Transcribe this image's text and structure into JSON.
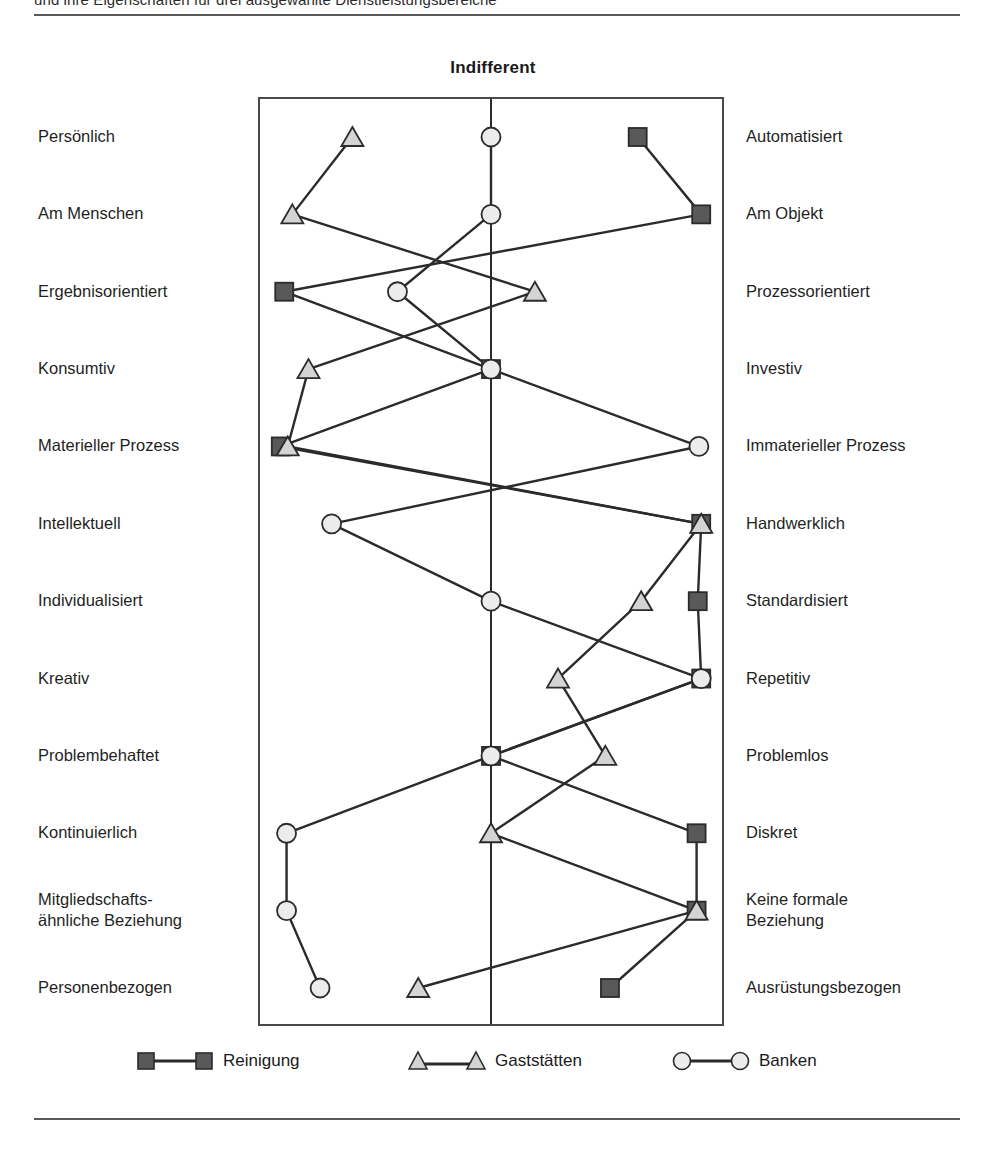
{
  "page": {
    "running_head": "und ihre Eigenschaften für drei ausgewählte Dienstleistungsbereiche"
  },
  "chart": {
    "title": "Indifferent",
    "axis_center_label": "Indifferent"
  },
  "legend": {
    "items": [
      {
        "name": "Reinigung",
        "marker": "square-marker",
        "fill": "#595959",
        "stroke": "#2b2b2b"
      },
      {
        "name": "Gaststätten",
        "marker": "triangle-marker",
        "fill": "#d4d4d4",
        "stroke": "#2b2b2b"
      },
      {
        "name": "Banken",
        "marker": "circle-marker",
        "fill": "#ececec",
        "stroke": "#2b2b2b"
      }
    ]
  },
  "chart_data": {
    "type": "line",
    "title": "Indifferent",
    "xlabel": "",
    "ylabel": "",
    "orientation": "horizontal-profile",
    "grid": false,
    "legend_position": "bottom",
    "xlim": [
      -2,
      2
    ],
    "axis_center": 0,
    "categories": [
      {
        "left": "Persönlich",
        "right": "Automatisiert"
      },
      {
        "left": "Am Menschen",
        "right": "Am Objekt"
      },
      {
        "left": "Ergebnisorientiert",
        "right": "Prozessorientiert"
      },
      {
        "left": "Konsumtiv",
        "right": "Investiv"
      },
      {
        "left": "Materieller Prozess",
        "right": "Immaterieller Prozess"
      },
      {
        "left": "Intellektuell",
        "right": "Handwerklich"
      },
      {
        "left": "Individualisiert",
        "right": "Standardisiert"
      },
      {
        "left": "Kreativ",
        "right": "Repetitiv"
      },
      {
        "left": "Problembehaftet",
        "right": "Problemlos"
      },
      {
        "left": "Kontinuierlich",
        "right": "Diskret"
      },
      {
        "left": "Mitgliedschafts-\nähnliche Beziehung",
        "right": "Keine formale\nBeziehung"
      },
      {
        "left": "Personenbezogen",
        "right": "Ausrüstungsbezogen"
      }
    ],
    "series": [
      {
        "name": "Reinigung",
        "marker": "square",
        "fill": "#595959",
        "stroke": "#2b2b2b",
        "values": [
          1.27,
          1.82,
          -1.79,
          0.0,
          -1.82,
          1.82,
          1.79,
          1.82,
          0.0,
          1.78,
          1.78,
          1.03
        ]
      },
      {
        "name": "Gaststätten",
        "marker": "triangle",
        "fill": "#d4d4d4",
        "stroke": "#2b2b2b",
        "values": [
          -1.2,
          -1.72,
          0.38,
          -1.58,
          -1.76,
          1.82,
          1.3,
          0.58,
          0.99,
          0.0,
          1.78,
          -0.63
        ]
      },
      {
        "name": "Banken",
        "marker": "circle",
        "fill": "#ececec",
        "stroke": "#2b2b2b",
        "values": [
          0.0,
          0.0,
          -0.81,
          0.0,
          1.8,
          -1.38,
          0.0,
          1.82,
          0.0,
          -1.77,
          -1.77,
          -1.48
        ]
      }
    ]
  }
}
